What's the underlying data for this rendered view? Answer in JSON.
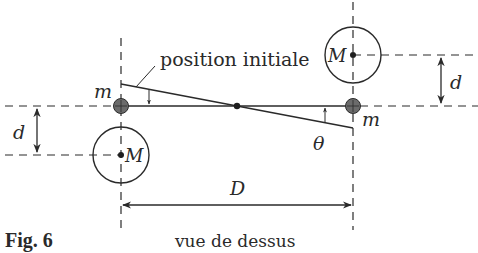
{
  "figure": {
    "caption": "Fig. 6",
    "view_label": "vue de dessus"
  },
  "labels": {
    "initial_position": "position initiale",
    "small_mass_left": "m",
    "small_mass_right": "m",
    "large_mass_top": "M",
    "large_mass_bottom": "M",
    "distance_d_right": "d",
    "distance_d_left": "d",
    "distance_D": "D",
    "angle": "θ"
  },
  "colors": {
    "line": "#2a2a2a",
    "small_mass_fill": "#6b6b6b",
    "background": "#ffffff"
  }
}
